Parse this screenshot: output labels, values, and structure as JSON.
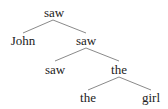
{
  "diagram": {
    "type": "dependency-tree",
    "nodes": [
      {
        "id": "n0",
        "label": "saw"
      },
      {
        "id": "n1",
        "label": "John"
      },
      {
        "id": "n2",
        "label": "saw"
      },
      {
        "id": "n3",
        "label": "saw"
      },
      {
        "id": "n4",
        "label": "the"
      },
      {
        "id": "n5",
        "label": "the"
      },
      {
        "id": "n6",
        "label": "girl"
      }
    ],
    "edges": [
      {
        "from": "n0",
        "to": "n1"
      },
      {
        "from": "n0",
        "to": "n2"
      },
      {
        "from": "n2",
        "to": "n3"
      },
      {
        "from": "n2",
        "to": "n4"
      },
      {
        "from": "n4",
        "to": "n5"
      },
      {
        "from": "n4",
        "to": "n6"
      }
    ]
  }
}
